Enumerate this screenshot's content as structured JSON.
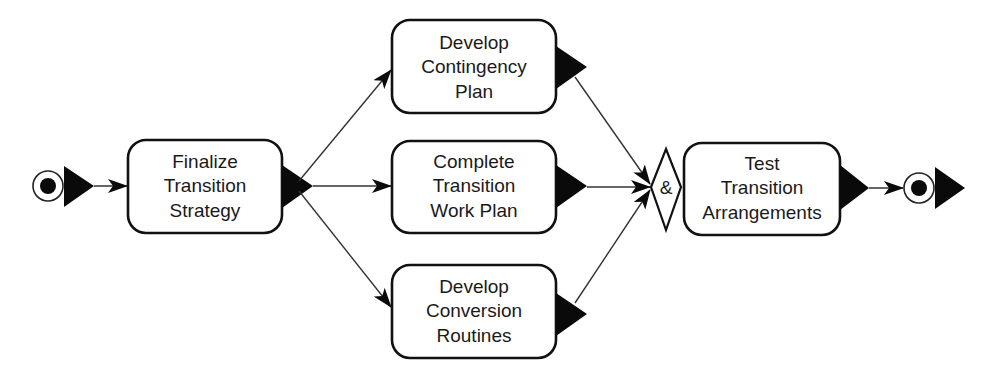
{
  "diagram": {
    "type": "activity-flow",
    "start_node": {
      "label": "start"
    },
    "end_node": {
      "label": "end"
    },
    "activities": [
      {
        "id": "finalize",
        "lines": [
          "Finalize",
          "Transition",
          "Strategy"
        ]
      },
      {
        "id": "contingency",
        "lines": [
          "Develop",
          "Contingency",
          "Plan"
        ]
      },
      {
        "id": "workplan",
        "lines": [
          "Complete",
          "Transition",
          "Work Plan"
        ]
      },
      {
        "id": "conversion",
        "lines": [
          "Develop",
          "Conversion",
          "Routines"
        ]
      },
      {
        "id": "test",
        "lines": [
          "Test",
          "Transition",
          "Arrangements"
        ]
      }
    ],
    "join": {
      "symbol": "&",
      "type": "AND-join"
    },
    "edges": [
      {
        "from": "start",
        "to": "finalize"
      },
      {
        "from": "finalize",
        "to": "contingency"
      },
      {
        "from": "finalize",
        "to": "workplan"
      },
      {
        "from": "finalize",
        "to": "conversion"
      },
      {
        "from": "contingency",
        "to": "join"
      },
      {
        "from": "workplan",
        "to": "join"
      },
      {
        "from": "conversion",
        "to": "join"
      },
      {
        "from": "join",
        "to": "test"
      },
      {
        "from": "test",
        "to": "end"
      }
    ],
    "colors": {
      "stroke": "#111111",
      "fill": "#ffffff",
      "text": "#1a1a1a"
    }
  }
}
